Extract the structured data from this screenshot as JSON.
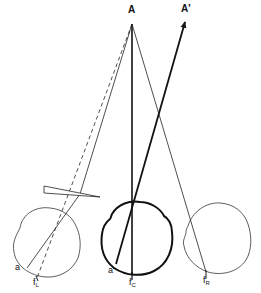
{
  "diagram": {
    "type": "optics-eye-prism-diagram",
    "labels": {
      "point_a": "A",
      "point_a_prime": "A'",
      "left_eye_a": "a",
      "center_eye_a": "a'",
      "fovea_left": "f",
      "fovea_left_sub": "L",
      "fovea_center": "f",
      "fovea_center_sub": "C",
      "fovea_right": "f",
      "fovea_right_sub": "R"
    },
    "elements": [
      {
        "id": "left-eye",
        "style": "thin",
        "center": [
          47,
          243
        ],
        "radius": 34
      },
      {
        "id": "cyclopean-eye",
        "style": "thick",
        "center": [
          137,
          237
        ],
        "radius": 35
      },
      {
        "id": "right-eye",
        "style": "thin",
        "center": [
          216,
          236
        ],
        "radius": 34
      },
      {
        "id": "prism",
        "shape": "wedge",
        "points": [
          [
            44,
            186
          ],
          [
            44,
            193
          ],
          [
            100,
            197
          ]
        ]
      }
    ],
    "colors": {
      "line": "#1a1a1a",
      "background": "#ffffff"
    }
  }
}
